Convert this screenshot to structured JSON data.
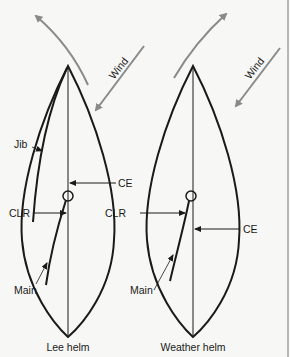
{
  "colors": {
    "background": "#f7f7f5",
    "ink": "#1a1a1a",
    "wind_arrow": "#8a8a8a",
    "border": "#b8b8b8"
  },
  "diagrams": [
    {
      "id": "lee-helm",
      "caption": "Lee helm",
      "wind_label": "Wind",
      "labels": {
        "jib": "Jib",
        "ce": "CE",
        "clr": "CLR",
        "main": "Main"
      }
    },
    {
      "id": "weather-helm",
      "caption": "Weather helm",
      "wind_label": "Wind",
      "labels": {
        "ce": "CE",
        "clr": "CLR",
        "main": "Main"
      }
    }
  ]
}
